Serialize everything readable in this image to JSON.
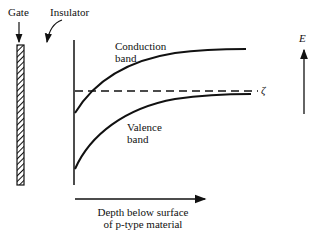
{
  "labels": {
    "gate": "Gate",
    "insulator": "Insulator",
    "conduction_1": "Conduction",
    "conduction_2": "band",
    "valence_1": "Valence",
    "valence_2": "band",
    "fermi": "ζ",
    "energy": "E",
    "xaxis_1": "Depth below surface",
    "xaxis_2": "of p-type material"
  }
}
